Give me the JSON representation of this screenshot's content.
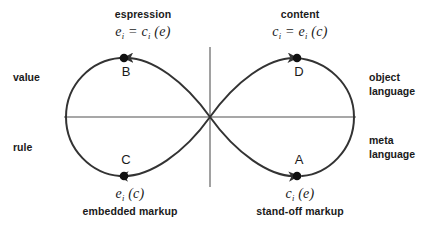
{
  "diagram": {
    "type": "lemniscate-figure-eight",
    "title_visible": false,
    "colors": {
      "curve": "#333333",
      "axis": "#808080",
      "point": "#111111",
      "text": "#1a1a1a",
      "background": "#ffffff"
    },
    "side_labels": {
      "left_top": "value",
      "left_bottom": "rule",
      "right_top": "object\nlanguage",
      "right_bottom": "meta\nlanguage"
    },
    "quadrants": {
      "top_left": {
        "caption": "espression",
        "formula_lhs_var": "e",
        "formula_lhs_sub": "i",
        "formula_eq": "=",
        "formula_rhs_var": "c",
        "formula_rhs_sub": "i",
        "formula_arg": "(e)",
        "point_label": "B"
      },
      "top_right": {
        "caption": "content",
        "formula_lhs_var": "c",
        "formula_lhs_sub": "i",
        "formula_eq": "=",
        "formula_rhs_var": "e",
        "formula_rhs_sub": "i",
        "formula_arg": "(c)",
        "point_label": "D"
      },
      "bottom_left": {
        "caption": "embedded markup",
        "formula_var": "e",
        "formula_sub": "i",
        "formula_arg": "(c)",
        "point_label": "C"
      },
      "bottom_right": {
        "caption": "stand-off markup",
        "formula_var": "c",
        "formula_sub": "i",
        "formula_arg": "(e)",
        "point_label": "A"
      }
    },
    "points": [
      {
        "id": "A",
        "label": "A",
        "quadrant": "bottom-right",
        "arrow_direction": "leftward"
      },
      {
        "id": "B",
        "label": "B",
        "quadrant": "top-left",
        "arrow_direction": "leftward"
      },
      {
        "id": "C",
        "label": "C",
        "quadrant": "bottom-left",
        "arrow_direction": "rightward"
      },
      {
        "id": "D",
        "label": "D",
        "quadrant": "top-right",
        "arrow_direction": "rightward"
      }
    ]
  }
}
